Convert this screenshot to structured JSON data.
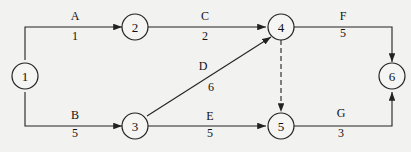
{
  "diagram": {
    "type": "activity-on-arrow network",
    "nodes": [
      {
        "id": "1",
        "label": "1"
      },
      {
        "id": "2",
        "label": "2"
      },
      {
        "id": "3",
        "label": "3"
      },
      {
        "id": "4",
        "label": "4"
      },
      {
        "id": "5",
        "label": "5"
      },
      {
        "id": "6",
        "label": "6"
      }
    ],
    "activities": [
      {
        "name": "A",
        "duration": "1",
        "from": "1",
        "to": "2"
      },
      {
        "name": "B",
        "duration": "5",
        "from": "1",
        "to": "3"
      },
      {
        "name": "C",
        "duration": "2",
        "from": "2",
        "to": "4"
      },
      {
        "name": "D",
        "duration": "6",
        "from": "3",
        "to": "4"
      },
      {
        "name": "E",
        "duration": "5",
        "from": "3",
        "to": "5"
      },
      {
        "name": "F",
        "duration": "5",
        "from": "4",
        "to": "6"
      },
      {
        "name": "G",
        "duration": "3",
        "from": "5",
        "to": "6"
      }
    ],
    "dummy": {
      "from": "4",
      "to": "5",
      "style": "dashed"
    }
  }
}
